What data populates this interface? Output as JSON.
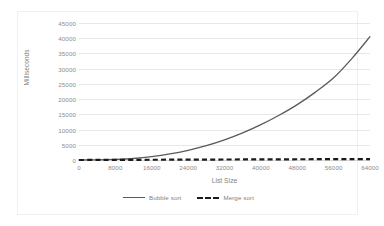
{
  "chart_data": {
    "type": "line",
    "title": "",
    "xlabel": "List Size",
    "ylabel": "Milliseconds",
    "xlim": [
      0,
      64000
    ],
    "ylim": [
      0,
      45000
    ],
    "x_ticks": [
      0,
      8000,
      16000,
      24000,
      32000,
      40000,
      48000,
      56000,
      64000
    ],
    "y_ticks": [
      0,
      5000,
      10000,
      15000,
      20000,
      25000,
      30000,
      35000,
      40000,
      45000
    ],
    "x_tick_labels": [
      "0",
      "8000",
      "16000",
      "24000",
      "32000",
      "40000",
      "48000",
      "56000",
      "64000"
    ],
    "y_tick_labels": [
      "0",
      "5000",
      "10000",
      "15000",
      "20000",
      "25000",
      "30000",
      "35000",
      "40000",
      "45000"
    ],
    "grid": "horizontal",
    "legend_position": "bottom",
    "x": [
      0,
      4000,
      8000,
      12000,
      16000,
      20000,
      24000,
      28000,
      32000,
      36000,
      40000,
      44000,
      48000,
      52000,
      56000,
      60000,
      64000
    ],
    "series": [
      {
        "name": "Bubble sort",
        "style": "solid",
        "color": "#5a5a5a",
        "values": [
          0,
          60,
          200,
          500,
          1100,
          2000,
          3200,
          4700,
          6600,
          8900,
          11600,
          14700,
          18200,
          22300,
          27000,
          33300,
          40500
        ]
      },
      {
        "name": "Merge sort",
        "style": "dashed",
        "color": "#1a1a1a",
        "values": [
          0,
          20,
          40,
          60,
          80,
          100,
          120,
          140,
          160,
          180,
          200,
          220,
          240,
          260,
          280,
          300,
          320
        ]
      }
    ],
    "legend": [
      {
        "label": "Bubble sort",
        "style": "solid"
      },
      {
        "label": "Merge sort",
        "style": "dashed"
      }
    ]
  }
}
